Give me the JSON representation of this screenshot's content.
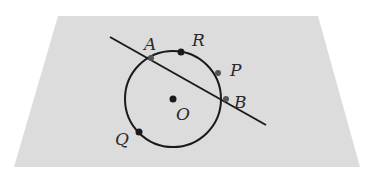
{
  "diagram": {
    "colors": {
      "background": "#ffffff",
      "plane": "#dcdcdc",
      "ink": "#1a1a1a",
      "gray_point": "#555555"
    },
    "plane": {
      "corners": [
        [
          58,
          16
        ],
        [
          318,
          16
        ],
        [
          360,
          167
        ],
        [
          14,
          167
        ]
      ]
    },
    "circle": {
      "center": "O",
      "cx": 173,
      "cy": 99,
      "r": 48
    },
    "line": {
      "x1": 110,
      "y1": 37,
      "x2": 266,
      "y2": 125,
      "through": [
        "A",
        "B"
      ]
    },
    "points": [
      {
        "name": "A",
        "label": "A",
        "x": 151,
        "y": 58,
        "lx": 144,
        "ly": 50
      },
      {
        "name": "R",
        "label": "R",
        "x": 181,
        "y": 52,
        "lx": 192,
        "ly": 46
      },
      {
        "name": "P",
        "label": "P",
        "x": 218,
        "y": 73,
        "lx": 230,
        "ly": 76
      },
      {
        "name": "B",
        "label": "B",
        "x": 226,
        "y": 99,
        "lx": 234,
        "ly": 108
      },
      {
        "name": "O",
        "label": "O",
        "x": 173,
        "y": 99,
        "lx": 176,
        "ly": 120
      },
      {
        "name": "Q",
        "label": "Q",
        "x": 139,
        "y": 132,
        "lx": 115,
        "ly": 145
      }
    ]
  }
}
